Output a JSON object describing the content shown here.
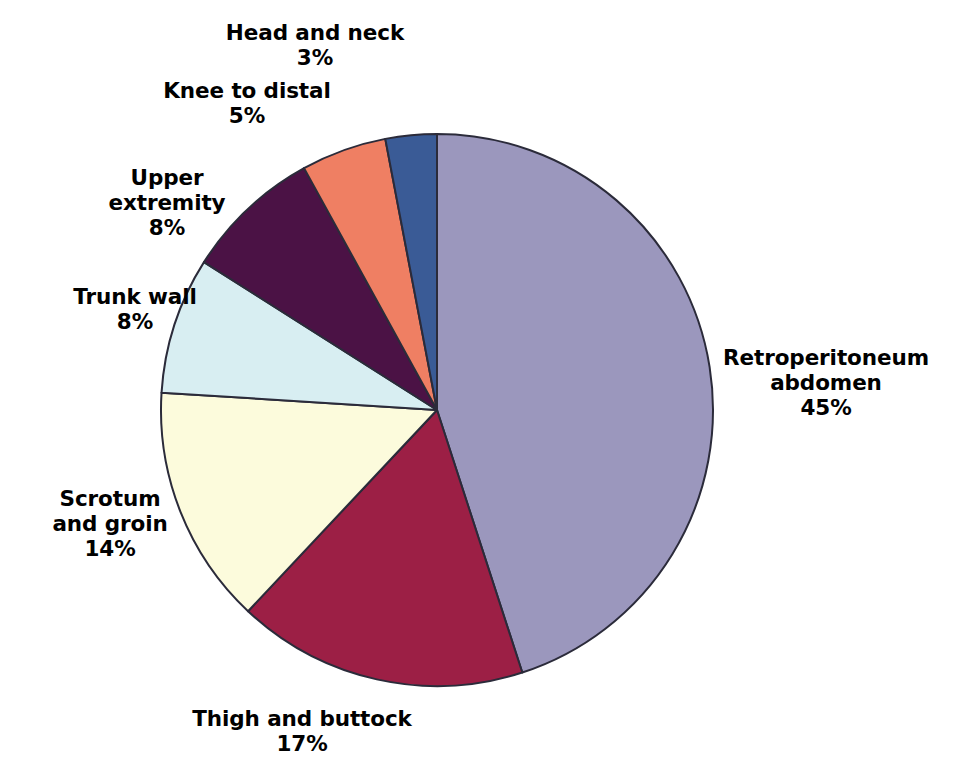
{
  "chart_data": {
    "type": "pie",
    "title": "",
    "subtitle": "",
    "xlabel": "",
    "ylabel": "",
    "legend_position": "none",
    "grid": false,
    "units": "%",
    "start_angle_deg": 0,
    "direction": "clockwise",
    "total": 100,
    "categories": [
      "Retroperitoneum abdomen",
      "Thigh and buttock",
      "Scrotum and groin",
      "Trunk wall",
      "Upper extremity",
      "Knee to distal",
      "Head and neck"
    ],
    "values": [
      45,
      17,
      14,
      8,
      8,
      5,
      3
    ],
    "colors": [
      "#9b97bd",
      "#9c1f45",
      "#fcfbdc",
      "#d8eef2",
      "#4b1245",
      "#ef7f63",
      "#3a5b96"
    ],
    "slices": [
      {
        "id": "retroperitoneum-abdomen",
        "label": "Retroperitoneum\nabdomen",
        "value": 45,
        "value_text": "45%",
        "color": "#9b97bd",
        "label_x": 826,
        "label_y": 383
      },
      {
        "id": "thigh-and-buttock",
        "label": "Thigh and buttock",
        "value": 17,
        "value_text": "17%",
        "color": "#9c1f45",
        "label_x": 302,
        "label_y": 732
      },
      {
        "id": "scrotum-and-groin",
        "label": "Scrotum\nand groin",
        "value": 14,
        "value_text": "14%",
        "color": "#fcfbdc",
        "label_x": 110,
        "label_y": 524
      },
      {
        "id": "trunk-wall",
        "label": "Trunk wall",
        "value": 8,
        "value_text": "8%",
        "color": "#d8eef2",
        "label_x": 135,
        "label_y": 310
      },
      {
        "id": "upper-extremity",
        "label": "Upper\nextremity",
        "value": 8,
        "value_text": "8%",
        "color": "#4b1245",
        "label_x": 167,
        "label_y": 203
      },
      {
        "id": "knee-to-distal",
        "label": "Knee to distal",
        "value": 5,
        "value_text": "5%",
        "color": "#ef7f63",
        "label_x": 247,
        "label_y": 104
      },
      {
        "id": "head-and-neck",
        "label": "Head and neck",
        "value": 3,
        "value_text": "3%",
        "color": "#3a5b96",
        "label_x": 315,
        "label_y": 46
      }
    ],
    "geometry": {
      "center_x": 437,
      "center_y": 410,
      "radius": 276,
      "stroke": "#2b2b3a",
      "stroke_width": 2
    }
  }
}
